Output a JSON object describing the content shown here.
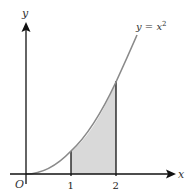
{
  "diagram": {
    "curve_label": "y = x",
    "curve_label_exponent": "2",
    "x_axis_label": "x",
    "y_axis_label": "y",
    "origin_label": "O",
    "ticks": [
      {
        "value": 1,
        "label": "1"
      },
      {
        "value": 2,
        "label": "2"
      }
    ],
    "shaded_region": {
      "from": 1,
      "to": 2,
      "fill": "#d9d9d9"
    },
    "curve_color": "#8a8a8a",
    "axis_color": "#111111"
  }
}
